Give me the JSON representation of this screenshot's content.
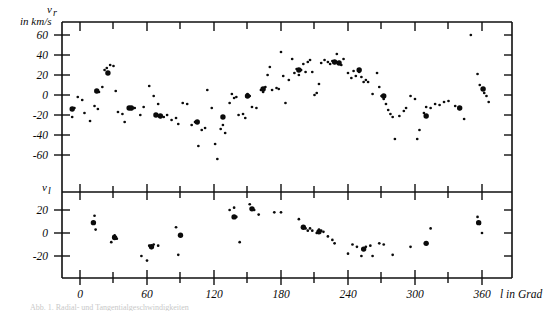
{
  "figure": {
    "title": "",
    "partial_caption": "Abb. 1. Radial- und Tangentialgeschwindigkeiten"
  },
  "axes": {
    "x": {
      "label": "l in Grad",
      "ticks": [
        0,
        60,
        120,
        180,
        240,
        300,
        360
      ],
      "tick_labels": [
        "0",
        "60",
        "120",
        "180",
        "240",
        "300",
        "360"
      ],
      "minor_ticks": [
        30,
        90,
        150,
        210,
        270,
        330
      ],
      "min": -12,
      "max": 372
    },
    "y_upper": {
      "label_symbol": "v",
      "label_subscript": "r",
      "label_units": "in km/s",
      "ticks": [
        60,
        40,
        20,
        0,
        -20,
        -40,
        -60
      ],
      "tick_labels": [
        "60",
        "40",
        "20",
        "0",
        "-20",
        "-40",
        "-60"
      ],
      "min": -72,
      "max": 78
    },
    "y_lower": {
      "label_symbol": "v",
      "label_subscript": "l",
      "ticks": [
        20,
        0,
        -20
      ],
      "tick_labels": [
        "20",
        "0",
        "-20"
      ],
      "min": -34,
      "max": 33
    }
  },
  "chart_data": [
    {
      "type": "scatter",
      "name": "radial-velocity-panel",
      "title": "",
      "xlabel": "l in Grad",
      "ylabel": "v_r in km/s",
      "xlim": [
        -12,
        372
      ],
      "ylim": [
        -72,
        78
      ],
      "grid": false,
      "legend": "none",
      "series": [
        {
          "name": "small-points",
          "marker": "small-dot",
          "points": [
            [
              -7,
              -22
            ],
            [
              -5,
              -13
            ],
            [
              -2,
              -2
            ],
            [
              2,
              -5
            ],
            [
              4,
              -18
            ],
            [
              9,
              -26
            ],
            [
              13,
              -11
            ],
            [
              16,
              -14
            ],
            [
              17,
              3
            ],
            [
              20,
              8
            ],
            [
              22,
              25
            ],
            [
              24,
              27
            ],
            [
              27,
              30
            ],
            [
              30,
              29
            ],
            [
              32,
              4
            ],
            [
              34,
              -17
            ],
            [
              38,
              -19
            ],
            [
              40,
              -27
            ],
            [
              46,
              -14
            ],
            [
              49,
              -13
            ],
            [
              54,
              -20
            ],
            [
              57,
              -12
            ],
            [
              62,
              9
            ],
            [
              66,
              -1
            ],
            [
              70,
              -9
            ],
            [
              72,
              -22
            ],
            [
              75,
              -22
            ],
            [
              78,
              -20
            ],
            [
              82,
              -25
            ],
            [
              86,
              -23
            ],
            [
              88,
              -29
            ],
            [
              92,
              -8
            ],
            [
              96,
              -9
            ],
            [
              100,
              -30
            ],
            [
              103,
              -27
            ],
            [
              106,
              -51
            ],
            [
              109,
              -35
            ],
            [
              112,
              -33
            ],
            [
              114,
              5
            ],
            [
              118,
              -13
            ],
            [
              121,
              -49
            ],
            [
              123,
              -64
            ],
            [
              126,
              -34
            ],
            [
              128,
              -30
            ],
            [
              130,
              -38
            ],
            [
              134,
              -8
            ],
            [
              136,
              1
            ],
            [
              138,
              -3
            ],
            [
              140,
              -2
            ],
            [
              142,
              -20
            ],
            [
              146,
              -19
            ],
            [
              148,
              -23
            ],
            [
              150,
              1
            ],
            [
              152,
              -1
            ],
            [
              154,
              -12
            ],
            [
              158,
              -13
            ],
            [
              162,
              5
            ],
            [
              164,
              3
            ],
            [
              166,
              8
            ],
            [
              168,
              20
            ],
            [
              170,
              28
            ],
            [
              172,
              5
            ],
            [
              176,
              7
            ],
            [
              178,
              6
            ],
            [
              180,
              43
            ],
            [
              182,
              19
            ],
            [
              184,
              -8
            ],
            [
              187,
              15
            ],
            [
              190,
              36
            ],
            [
              192,
              22
            ],
            [
              194,
              26
            ],
            [
              196,
              20
            ],
            [
              198,
              25
            ],
            [
              200,
              31
            ],
            [
              202,
              23
            ],
            [
              204,
              33
            ],
            [
              206,
              35
            ],
            [
              208,
              23
            ],
            [
              210,
              0
            ],
            [
              212,
              2
            ],
            [
              214,
              11
            ],
            [
              216,
              32
            ],
            [
              219,
              35
            ],
            [
              222,
              33
            ],
            [
              224,
              31
            ],
            [
              226,
              34
            ],
            [
              228,
              32
            ],
            [
              230,
              41
            ],
            [
              232,
              33
            ],
            [
              234,
              30
            ],
            [
              236,
              36
            ],
            [
              240,
              22
            ],
            [
              243,
              17
            ],
            [
              245,
              24
            ],
            [
              247,
              19
            ],
            [
              250,
              23
            ],
            [
              252,
              18
            ],
            [
              254,
              13
            ],
            [
              256,
              15
            ],
            [
              258,
              13
            ],
            [
              262,
              1
            ],
            [
              266,
              22
            ],
            [
              268,
              8
            ],
            [
              270,
              -1
            ],
            [
              272,
              -4
            ],
            [
              274,
              -9
            ],
            [
              276,
              -15
            ],
            [
              278,
              -19
            ],
            [
              280,
              -22
            ],
            [
              282,
              -44
            ],
            [
              286,
              -21
            ],
            [
              290,
              -16
            ],
            [
              292,
              -13
            ],
            [
              296,
              -1
            ],
            [
              300,
              -4
            ],
            [
              302,
              -44
            ],
            [
              304,
              -35
            ],
            [
              308,
              -18
            ],
            [
              310,
              -12
            ],
            [
              314,
              -13
            ],
            [
              318,
              -9
            ],
            [
              322,
              -10
            ],
            [
              326,
              -7
            ],
            [
              330,
              -6
            ],
            [
              336,
              -11
            ],
            [
              340,
              -14
            ],
            [
              344,
              -24
            ],
            [
              350,
              60
            ],
            [
              356,
              21
            ],
            [
              358,
              10
            ],
            [
              360,
              6
            ],
            [
              362,
              2
            ],
            [
              364,
              -1
            ],
            [
              366,
              -7
            ]
          ]
        },
        {
          "name": "large-points",
          "marker": "large-dot",
          "points": [
            [
              -7,
              -14
            ],
            [
              15,
              4
            ],
            [
              25,
              22
            ],
            [
              44,
              -13
            ],
            [
              46,
              -13
            ],
            [
              68,
              -20
            ],
            [
              72,
              -21
            ],
            [
              105,
              -27
            ],
            [
              128,
              -22
            ],
            [
              150,
              -1
            ],
            [
              164,
              6
            ],
            [
              196,
              25
            ],
            [
              228,
              33
            ],
            [
              232,
              32
            ],
            [
              250,
              25
            ],
            [
              272,
              -1
            ],
            [
              310,
              -21
            ],
            [
              340,
              -13
            ],
            [
              361,
              6
            ]
          ]
        }
      ]
    },
    {
      "type": "scatter",
      "name": "tangential-velocity-panel",
      "title": "",
      "xlabel": "l in Grad",
      "ylabel": "v_l",
      "xlim": [
        -12,
        372
      ],
      "ylim": [
        -34,
        33
      ],
      "grid": false,
      "legend": "none",
      "series": [
        {
          "name": "small-points",
          "marker": "small-dot",
          "points": [
            [
              13,
              15
            ],
            [
              14,
              3
            ],
            [
              28,
              -8
            ],
            [
              30,
              -3
            ],
            [
              31,
              -2
            ],
            [
              33,
              -5
            ],
            [
              55,
              -20
            ],
            [
              60,
              -24
            ],
            [
              62,
              -11
            ],
            [
              64,
              -13
            ],
            [
              66,
              -10
            ],
            [
              70,
              -11
            ],
            [
              86,
              5
            ],
            [
              88,
              -19
            ],
            [
              134,
              20
            ],
            [
              138,
              22
            ],
            [
              140,
              14
            ],
            [
              143,
              -8
            ],
            [
              152,
              25
            ],
            [
              156,
              20
            ],
            [
              160,
              16
            ],
            [
              174,
              18
            ],
            [
              180,
              18
            ],
            [
              196,
              12
            ],
            [
              200,
              5
            ],
            [
              202,
              4
            ],
            [
              204,
              2
            ],
            [
              206,
              4
            ],
            [
              208,
              2
            ],
            [
              212,
              0
            ],
            [
              214,
              3
            ],
            [
              216,
              2
            ],
            [
              218,
              1
            ],
            [
              222,
              -3
            ],
            [
              226,
              -6
            ],
            [
              228,
              -9
            ],
            [
              240,
              -18
            ],
            [
              244,
              -10
            ],
            [
              248,
              -12
            ],
            [
              252,
              -20
            ],
            [
              256,
              -12
            ],
            [
              260,
              -11
            ],
            [
              262,
              -20
            ],
            [
              268,
              -9
            ],
            [
              272,
              -10
            ],
            [
              280,
              -19
            ],
            [
              296,
              -12
            ],
            [
              314,
              4
            ],
            [
              356,
              14
            ],
            [
              358,
              8
            ],
            [
              360,
              0
            ]
          ]
        },
        {
          "name": "large-points",
          "marker": "large-dot",
          "points": [
            [
              12,
              9
            ],
            [
              31,
              -4
            ],
            [
              64,
              -12
            ],
            [
              90,
              -2
            ],
            [
              138,
              14
            ],
            [
              154,
              21
            ],
            [
              200,
              5
            ],
            [
              214,
              1
            ],
            [
              254,
              -14
            ],
            [
              310,
              -9
            ],
            [
              357,
              9
            ]
          ]
        }
      ]
    }
  ]
}
